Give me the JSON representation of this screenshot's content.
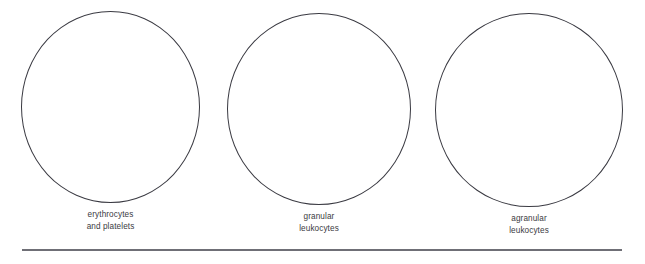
{
  "figure": {
    "background_color": "#ffffff",
    "outline_color": "#3a3a42",
    "text_color": "#3b3b42",
    "rule_color": "#6f6f76"
  },
  "groups": [
    {
      "id": "erythrocytes",
      "caption_lines": [
        "erythrocytes",
        "and platelets"
      ]
    },
    {
      "id": "granular",
      "caption_lines": [
        "granular",
        "leukocytes"
      ]
    },
    {
      "id": "agranular",
      "caption_lines": [
        "agranular",
        "leukocytes"
      ]
    }
  ]
}
